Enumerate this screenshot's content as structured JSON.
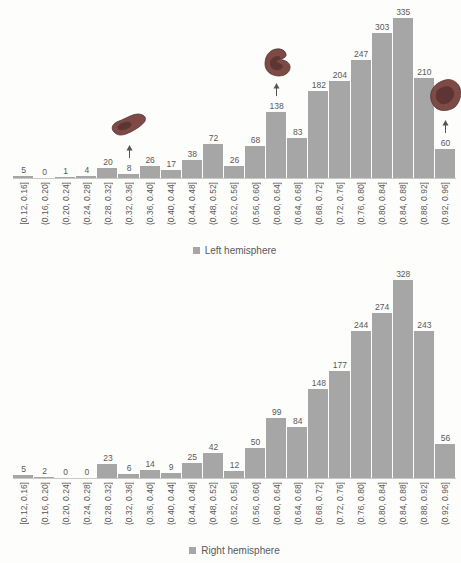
{
  "figure": {
    "bar_color": "#a6a6a6",
    "text_color": "#595959",
    "axis_color": "#c9c9c7",
    "annotation_blob_color": "#7e4a46"
  },
  "chart_data": [
    {
      "type": "bar",
      "subtype": "histogram",
      "legend": "Left hemisphere",
      "legend_position": "bottom-center",
      "grid": false,
      "bar_value_labels": true,
      "categories": [
        "[0.12, 0.16]",
        "(0.16, 0.20]",
        "(0.20, 0.24]",
        "(0.24, 0.28]",
        "(0.28, 0.32]",
        "(0.32, 0.36]",
        "(0.36, 0.40]",
        "(0.40, 0.44]",
        "(0.44, 0.48]",
        "(0.48, 0.52]",
        "(0.52, 0.56]",
        "(0.56, 0.60]",
        "(0.60, 0.64]",
        "(0.64, 0.68]",
        "(0.68, 0.72]",
        "(0.72, 0.76]",
        "(0.76, 0.80]",
        "(0.80, 0.84]",
        "(0.84, 0.88]",
        "(0.88, 0.92]",
        "(0.92, 0.96]"
      ],
      "values": [
        5,
        0,
        1,
        4,
        20,
        8,
        26,
        17,
        38,
        72,
        26,
        68,
        138,
        83,
        182,
        204,
        247,
        303,
        335,
        210,
        60
      ],
      "ylim": [
        0,
        350
      ],
      "annotations": [
        {
          "target_bin": "(0.32, 0.36]",
          "target_value": 8,
          "marker": "brain-parcel-thumbnail",
          "arrow": "up"
        },
        {
          "target_bin": "(0.60, 0.64]",
          "target_value": 138,
          "marker": "brain-parcel-thumbnail",
          "arrow": "up"
        },
        {
          "target_bin": "(0.92, 0.96]",
          "target_value": 60,
          "marker": "brain-parcel-thumbnail",
          "arrow": "up"
        }
      ]
    },
    {
      "type": "bar",
      "subtype": "histogram",
      "legend": "Right hemisphere",
      "legend_position": "bottom-center",
      "grid": false,
      "bar_value_labels": true,
      "categories": [
        "[0.12, 0.16]",
        "(0.16, 0.20]",
        "(0.20, 0.24]",
        "(0.24, 0.28]",
        "(0.28, 0.32]",
        "(0.32, 0.36]",
        "(0.36, 0.40]",
        "(0.40, 0.44]",
        "(0.44, 0.48]",
        "(0.48, 0.52]",
        "(0.52, 0.56]",
        "(0.56, 0.60]",
        "(0.60, 0.64]",
        "(0.64, 0.68]",
        "(0.68, 0.72]",
        "(0.72, 0.76]",
        "(0.76, 0.80]",
        "(0.80, 0.84]",
        "(0.84, 0.88]",
        "(0.88, 0.92]",
        "(0.92, 0.96]"
      ],
      "values": [
        5,
        2,
        0,
        0,
        23,
        6,
        14,
        9,
        25,
        42,
        12,
        50,
        99,
        84,
        148,
        177,
        244,
        274,
        328,
        243,
        56
      ],
      "ylim": [
        0,
        340
      ],
      "annotations": []
    }
  ]
}
